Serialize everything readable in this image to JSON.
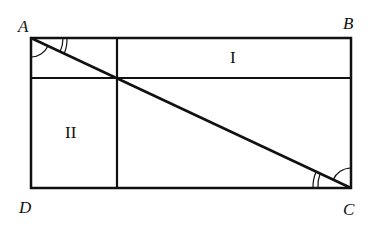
{
  "diagram": {
    "points": {
      "A": {
        "label": "A",
        "x": 31,
        "y": 38
      },
      "B": {
        "label": "B",
        "x": 351,
        "y": 38
      },
      "C": {
        "label": "C",
        "x": 351,
        "y": 188
      },
      "D": {
        "label": "D",
        "x": 31,
        "y": 188
      }
    },
    "regions": {
      "I": {
        "label": "I"
      },
      "II": {
        "label": "II"
      }
    },
    "stroke_color": "#111111"
  }
}
